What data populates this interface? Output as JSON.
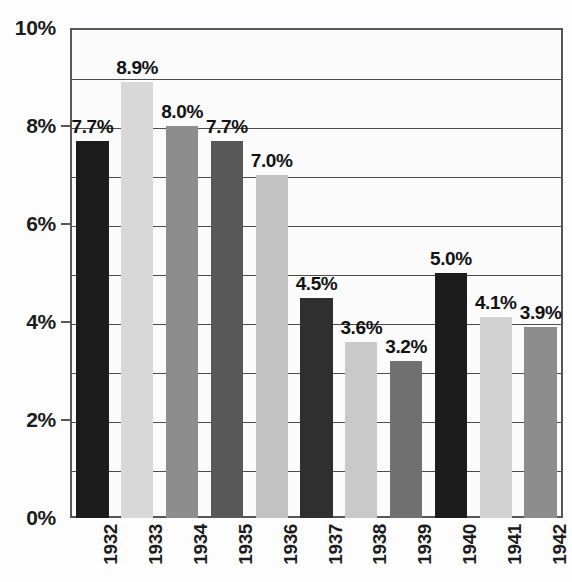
{
  "chart_data": {
    "type": "bar",
    "title": "",
    "xlabel": "",
    "ylabel": "",
    "categories": [
      "1932",
      "1933",
      "1934",
      "1935",
      "1936",
      "1937",
      "1938",
      "1939",
      "1940",
      "1941",
      "1942"
    ],
    "values": [
      7.7,
      8.9,
      8.0,
      7.7,
      7.0,
      4.5,
      3.6,
      3.2,
      5.0,
      4.1,
      3.9
    ],
    "value_labels": [
      "7.7%",
      "8.9%",
      "8.0%",
      "7.7%",
      "7.0%",
      "4.5%",
      "3.6%",
      "3.2%",
      "5.0%",
      "4.1%",
      "3.9%"
    ],
    "bar_colors": [
      "#1c1c1c",
      "#d8d8d8",
      "#8d8d8d",
      "#585858",
      "#c2c2c2",
      "#2f2f2f",
      "#c9c9c9",
      "#707070",
      "#1c1c1c",
      "#d2d2d2",
      "#8d8d8d"
    ],
    "ylim": [
      0,
      10
    ],
    "ytick_values": [
      0,
      2,
      4,
      6,
      8,
      10
    ],
    "ytick_labels": [
      "0%",
      "2%",
      "4%",
      "6%",
      "8%",
      "10%"
    ],
    "gridline_values": [
      1,
      2,
      3,
      4,
      5,
      6,
      7,
      8,
      9,
      10
    ],
    "grid": true,
    "legend": "none",
    "unit": "%"
  },
  "axes": {
    "y_labels": [
      "10%",
      "8%",
      "6%",
      "4%",
      "2%",
      "0%"
    ],
    "x_labels": [
      "1932",
      "1933",
      "1934",
      "1935",
      "1936",
      "1937",
      "1938",
      "1939",
      "1940",
      "1941",
      "1942"
    ]
  },
  "colors": {
    "frame": "#55555a",
    "gridline": "#4b4b50",
    "text": "#1c1c1c",
    "background": "#fdfdfd"
  }
}
